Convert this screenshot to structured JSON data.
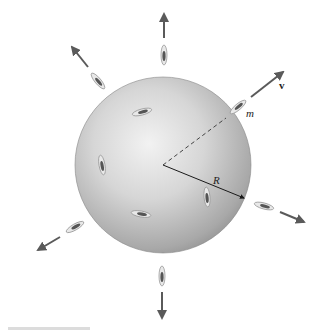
{
  "diagram": {
    "labels": {
      "velocity": "v",
      "mass": "m",
      "radius": "R"
    },
    "colors": {
      "sphere_light": "#efefef",
      "sphere_mid": "#c4c4c4",
      "sphere_dark": "#8a8a8a",
      "arrow": "#5a5a5a",
      "line": "#2a2a2a",
      "particle": "#6a6a6a",
      "background": "#ffffff"
    },
    "sphere": {
      "cx": 163,
      "cy": 165,
      "r": 88
    },
    "particles_outside": 8,
    "particles_on_surface": 4
  }
}
